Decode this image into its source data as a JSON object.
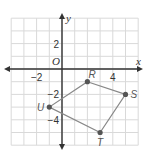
{
  "chart_data": {
    "type": "scatter",
    "title": "",
    "xlabel": "x",
    "ylabel": "y",
    "origin_label": "O",
    "xlim": [
      -4,
      6
    ],
    "ylim": [
      -6,
      4
    ],
    "grid": true,
    "x_ticks": [
      {
        "value": -2,
        "label": "−2"
      },
      {
        "value": 4,
        "label": "4"
      }
    ],
    "y_ticks": [
      {
        "value": 2,
        "label": "2"
      },
      {
        "value": -2,
        "label": "−2"
      },
      {
        "value": -4,
        "label": "−4"
      }
    ],
    "points": [
      {
        "name": "R",
        "x": 2,
        "y": -1
      },
      {
        "name": "S",
        "x": 5,
        "y": -2
      },
      {
        "name": "T",
        "x": 3,
        "y": -5
      },
      {
        "name": "U",
        "x": -1,
        "y": -3
      }
    ],
    "polygon": [
      "R",
      "S",
      "T",
      "U"
    ]
  },
  "colors": {
    "grid": "#d9d9d9",
    "axis": "#333333",
    "polygon": "#888888",
    "point": "#555555"
  }
}
